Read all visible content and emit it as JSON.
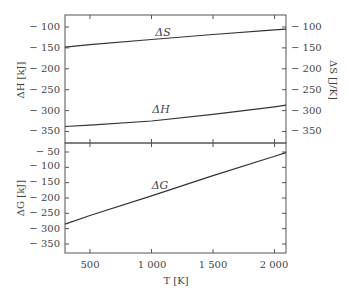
{
  "chart_data": [
    {
      "type": "line",
      "panel": "top",
      "title": "",
      "xlabel": "T [K]",
      "ylabel_left": "ΔH [kJ]",
      "ylabel_right": "ΔS [J/K]",
      "xlim": [
        297,
        2093
      ],
      "ylim": [
        -380,
        -70
      ],
      "yticks_left": [
        -100,
        -150,
        -200,
        -250,
        -300,
        -350
      ],
      "yticks_right": [
        -100,
        -150,
        -200,
        -250,
        -300,
        -350
      ],
      "grid": false,
      "series": [
        {
          "name": "ΔS",
          "axis": "right",
          "x": [
            297,
            500,
            1000,
            1500,
            2000,
            2093
          ],
          "values": [
            -148,
            -142,
            -130,
            -118,
            -107,
            -105
          ]
        },
        {
          "name": "ΔH",
          "axis": "left",
          "x": [
            297,
            500,
            1000,
            1500,
            2000,
            2093
          ],
          "values": [
            -338,
            -335,
            -325,
            -309,
            -291,
            -287
          ]
        }
      ]
    },
    {
      "type": "line",
      "panel": "bottom",
      "title": "",
      "xlabel": "T [K]",
      "ylabel": "ΔG [kJ]",
      "xlim": [
        297,
        2093
      ],
      "ylim": [
        -375,
        -20
      ],
      "xticks": [
        500,
        1000,
        1500,
        2000
      ],
      "xtick_labels": [
        "500",
        "1 000",
        "1 500",
        "2 000"
      ],
      "yticks": [
        -50,
        -100,
        -150,
        -200,
        -250,
        -300,
        -350
      ],
      "grid": false,
      "series": [
        {
          "name": "ΔG",
          "x": [
            297,
            500,
            1000,
            1500,
            2000,
            2093
          ],
          "values": [
            -285,
            -257,
            -193,
            -127,
            -64,
            -52
          ]
        }
      ]
    }
  ],
  "labels": {
    "top_left_axis": "ΔH [kJ]",
    "top_right_axis": "ΔS [J/K]",
    "bottom_left_axis": "ΔG [kJ]",
    "x_axis": "T [K]",
    "curve_S": "ΔS",
    "curve_H": "ΔH",
    "curve_G": "ΔG"
  },
  "ticks": {
    "top_left": [
      "− 100",
      "− 150",
      "− 200",
      "− 250",
      "− 300",
      "− 350"
    ],
    "top_right": [
      "− 100",
      "− 150",
      "− 200",
      "− 250",
      "− 300",
      "− 350"
    ],
    "bottom_left": [
      "− 50",
      "− 100",
      "− 150",
      "− 200",
      "− 250",
      "− 300",
      "− 350"
    ],
    "x": [
      "500",
      "1 000",
      "1 500",
      "2 000"
    ]
  }
}
